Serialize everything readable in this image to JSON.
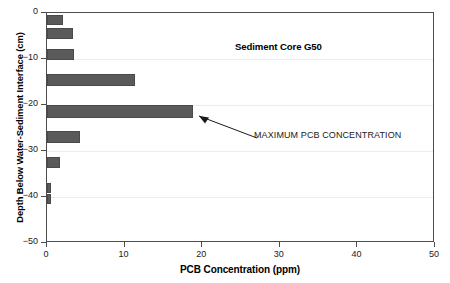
{
  "figure": {
    "panel_label": "(c)",
    "title": "Sediment Core G50",
    "xlabel": "PCB Concentration (ppm)",
    "ylabel": "Depth Below Water-Sediment Interface (cm)",
    "annotation": "MAXIMUM PCB CONCENTRATION"
  },
  "chart_data": {
    "type": "bar",
    "orientation": "horizontal",
    "title": "Sediment Core G50",
    "xlabel": "PCB Concentration (ppm)",
    "ylabel": "Depth Below Water-Sediment Interface (cm)",
    "xlim": [
      0,
      50
    ],
    "ylim": [
      -50,
      0
    ],
    "xticks": [
      0,
      10,
      20,
      30,
      40,
      50
    ],
    "xtick_labels": [
      "0",
      "10",
      "20",
      "30",
      "40",
      "50"
    ],
    "yticks": [
      0,
      -10,
      -20,
      -30,
      -40,
      -50
    ],
    "ytick_labels": [
      "0",
      "−10",
      "−20",
      "−30",
      "−40",
      "−50"
    ],
    "grid": "horizontal-light",
    "legend": null,
    "bar_color": "#5a5a5a",
    "categories": [
      -1.5,
      -4.5,
      -9.0,
      -14.5,
      -21.5,
      -27.0,
      -32.5,
      -38.0,
      -40.5
    ],
    "values": [
      2.1,
      3.4,
      3.5,
      11.4,
      18.8,
      4.3,
      1.7,
      0.5,
      0.5
    ],
    "bar_thickness_cm": [
      2.2,
      2.4,
      2.4,
      2.6,
      2.8,
      2.6,
      2.4,
      2.2,
      2.2
    ],
    "annotations": [
      {
        "text": "MAXIMUM PCB CONCENTRATION",
        "points_to_depth": -21.5,
        "points_to_value": 18.8
      }
    ]
  }
}
